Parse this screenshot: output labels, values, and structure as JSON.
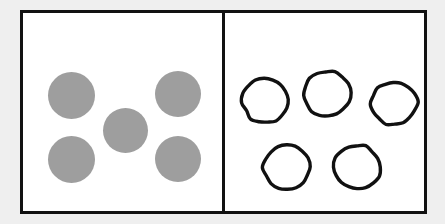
{
  "figure": {
    "background_color": "#efefef",
    "panel_background_color": "#ffffff",
    "border_color": "#111111",
    "border_width_px": 3,
    "frame": {
      "x": 20,
      "y": 10,
      "width": 407,
      "height": 204
    },
    "divider": {
      "x": 219,
      "orientation": "vertical",
      "width_px": 3
    }
  },
  "panels": [
    {
      "id": "panel-filled",
      "name": "left-panel",
      "style": "solid-filled-circles",
      "fill_color": "#9e9e9e",
      "count": 5,
      "arrangement": "quincunx",
      "items": [
        {
          "name": "dot-top-left",
          "cx": 48,
          "cy": 82,
          "r": 23.5
        },
        {
          "name": "dot-top-right",
          "cx": 155,
          "cy": 81,
          "r": 23.0
        },
        {
          "name": "dot-center",
          "cx": 102,
          "cy": 117,
          "r": 22.5
        },
        {
          "name": "dot-bottom-left",
          "cx": 48,
          "cy": 146,
          "r": 23.5
        },
        {
          "name": "dot-bottom-right",
          "cx": 155,
          "cy": 146,
          "r": 23.0
        }
      ]
    },
    {
      "id": "panel-outline",
      "name": "right-panel",
      "style": "hand-drawn-outline-circles",
      "stroke_color": "#111111",
      "stroke_width_px": 3.4,
      "count": 5,
      "arrangement": "three-top-two-bottom",
      "items": [
        {
          "name": "circle-top-1",
          "cx": 41,
          "cy": 88,
          "r": 22.5
        },
        {
          "name": "circle-top-2",
          "cx": 102,
          "cy": 81,
          "r": 23.0
        },
        {
          "name": "circle-top-3",
          "cx": 169,
          "cy": 90,
          "r": 22.5
        },
        {
          "name": "circle-bottom-1",
          "cx": 62,
          "cy": 154,
          "r": 22.5
        },
        {
          "name": "circle-bottom-2",
          "cx": 132,
          "cy": 154,
          "r": 22.5
        }
      ]
    }
  ]
}
